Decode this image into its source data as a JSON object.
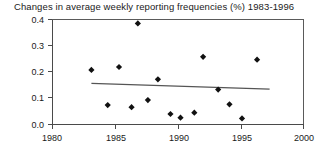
{
  "chart_data": {
    "type": "scatter",
    "title": "Changes in average weekly reporting frequencies (%) 1983-1996",
    "xlabel": "",
    "ylabel": "",
    "xlim": [
      1980,
      2000
    ],
    "ylim": [
      0.0,
      0.4
    ],
    "grid": false,
    "legend": "none",
    "xticks": [
      "1980",
      "1985",
      "1990",
      "1995",
      "2000"
    ],
    "xtick_values": [
      1980,
      1985,
      1990,
      1995,
      2000
    ],
    "yticks": [
      "0.0",
      "0.1",
      "0.2",
      "0.3",
      "0.4"
    ],
    "ytick_values": [
      0.0,
      0.1,
      0.2,
      0.3,
      0.4
    ],
    "series": [
      {
        "name": "Change in average weekly reporting frequency",
        "marker": "diamond",
        "color": "#111111",
        "points": [
          {
            "x": 1983.1,
            "y": 0.208
          },
          {
            "x": 1984.4,
            "y": 0.074
          },
          {
            "x": 1985.3,
            "y": 0.219
          },
          {
            "x": 1986.3,
            "y": 0.066
          },
          {
            "x": 1986.8,
            "y": 0.385
          },
          {
            "x": 1987.6,
            "y": 0.093
          },
          {
            "x": 1988.4,
            "y": 0.172
          },
          {
            "x": 1989.4,
            "y": 0.04
          },
          {
            "x": 1990.2,
            "y": 0.026
          },
          {
            "x": 1991.3,
            "y": 0.045
          },
          {
            "x": 1992.0,
            "y": 0.258
          },
          {
            "x": 1993.2,
            "y": 0.133
          },
          {
            "x": 1994.1,
            "y": 0.077
          },
          {
            "x": 1995.1,
            "y": 0.023
          },
          {
            "x": 1996.3,
            "y": 0.247
          }
        ]
      }
    ],
    "trend_line": {
      "name": "linear fit",
      "color": "#555555",
      "x_start": 1983.1,
      "y_start": 0.157,
      "x_end": 1997.3,
      "y_end": 0.135
    }
  }
}
